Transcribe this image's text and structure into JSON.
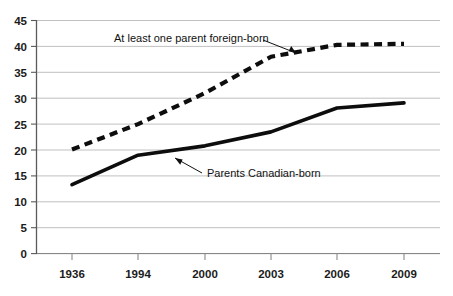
{
  "chart_data": {
    "type": "line",
    "title": "",
    "subtitle": "",
    "xlabel": "",
    "ylabel": "",
    "categories": [
      "1936",
      "1994",
      "2000",
      "2003",
      "2006",
      "2009"
    ],
    "x_tick_labels": [
      "1936",
      "1994",
      "2000",
      "2003",
      "2006",
      "2009"
    ],
    "y_tick_labels": [
      "0",
      "5",
      "10",
      "15",
      "20",
      "25",
      "30",
      "35",
      "40",
      "45"
    ],
    "y_ticks": [
      0,
      5,
      10,
      15,
      20,
      25,
      30,
      35,
      40,
      45
    ],
    "ylim": [
      0,
      45
    ],
    "grid": "horizontal",
    "legend_position": "inline-annotations",
    "series": [
      {
        "name": "At least one parent foreign-born",
        "style": "dashed",
        "color": "#0d0d0d",
        "values": [
          20.1,
          25.0,
          31.0,
          38.0,
          40.3,
          40.5
        ]
      },
      {
        "name": "Parents Canadian-born",
        "style": "solid",
        "color": "#0d0d0d",
        "values": [
          13.3,
          19.0,
          20.8,
          23.5,
          28.1,
          29.1
        ]
      }
    ],
    "annotations": [
      {
        "id": "annotation-foreign-born",
        "text": "At least one parent foreign-born",
        "points_to_series": "At least one parent foreign-born",
        "arrow_direction": "down-right"
      },
      {
        "id": "annotation-canadian-born",
        "text": "Parents Canadian-born",
        "points_to_series": "Parents Canadian-born",
        "arrow_direction": "up-left"
      }
    ],
    "caption_fragment": "",
    "colors": {
      "gridline": "#b9b9b9",
      "axis": "#5f5f5f",
      "series": "#0d0d0d",
      "text": "#1b1b1b",
      "background": "#ffffff"
    }
  }
}
